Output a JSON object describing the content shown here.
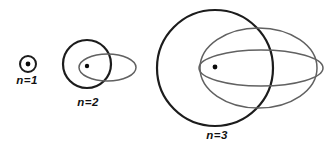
{
  "diagram": {
    "background": "#ffffff",
    "colors": {
      "circle_stroke": "#1c1c1c",
      "ellipse_stroke": "#616161",
      "dot_fill": "#0a0a0a",
      "label": "#111111"
    },
    "groups": [
      {
        "name": "n1",
        "label": "n=1",
        "label_pos": {
          "x": 27,
          "y": 84
        },
        "nucleus": {
          "x": 28,
          "y": 64,
          "r": 2.4
        },
        "orbits": [
          {
            "kind": "circle",
            "cx": 28,
            "cy": 64,
            "rx": 8,
            "ry": 8,
            "stroke": "circle",
            "width": 2.0
          }
        ]
      },
      {
        "name": "n2",
        "label": "n=2",
        "label_pos": {
          "x": 88,
          "y": 106
        },
        "nucleus": {
          "x": 87,
          "y": 66,
          "r": 2.2
        },
        "orbits": [
          {
            "kind": "circle",
            "cx": 87,
            "cy": 64,
            "rx": 24,
            "ry": 24,
            "stroke": "circle",
            "width": 2.2
          },
          {
            "kind": "ellipse",
            "cx": 107.5,
            "cy": 67.5,
            "rx": 28.5,
            "ry": 13.5,
            "stroke": "ellipse",
            "width": 1.5
          }
        ]
      },
      {
        "name": "n3",
        "label": "n=3",
        "label_pos": {
          "x": 217,
          "y": 139
        },
        "nucleus": {
          "x": 215,
          "y": 67,
          "r": 2.4
        },
        "orbits": [
          {
            "kind": "circle",
            "cx": 215,
            "cy": 68,
            "rx": 58,
            "ry": 58,
            "stroke": "circle",
            "width": 2.2
          },
          {
            "kind": "ellipse",
            "cx": 258.5,
            "cy": 68,
            "rx": 58.5,
            "ry": 40,
            "stroke": "ellipse",
            "width": 1.5
          },
          {
            "kind": "ellipse",
            "cx": 261,
            "cy": 68,
            "rx": 62,
            "ry": 18,
            "stroke": "ellipse",
            "width": 1.5
          }
        ]
      }
    ],
    "canvas": {
      "width": 334,
      "height": 148
    }
  }
}
